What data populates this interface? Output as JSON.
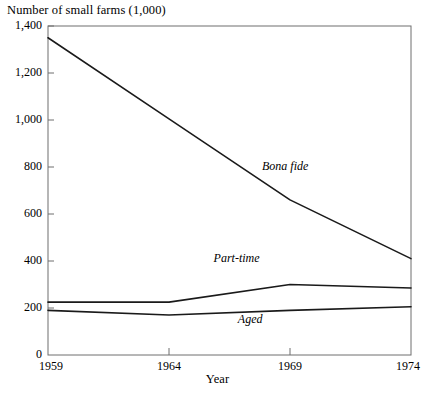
{
  "chart_data": {
    "type": "line",
    "title": "Number of small farms  (1,000)",
    "xlabel": "Year",
    "ylabel": "Number of small farms (1,000)",
    "x": [
      1959,
      1964,
      1969,
      1974
    ],
    "categories": [
      "1959",
      "1964",
      "1969",
      "1974"
    ],
    "xlim": [
      1959,
      1974
    ],
    "ylim": [
      0,
      1400
    ],
    "grid": false,
    "legend_position": "inline-annotations",
    "yticks": [
      0,
      200,
      400,
      600,
      800,
      1000,
      1200,
      1400
    ],
    "ytick_labels": [
      "0",
      "200",
      "400",
      "600",
      "800",
      "1,000",
      "1,200",
      "1,400"
    ],
    "xticks": [
      1959,
      1964,
      1969,
      1974
    ],
    "xtick_labels": [
      "1959",
      "1964",
      "1969",
      "1974"
    ],
    "line_color": "#1a1a1a",
    "axis_color": "#6e6e6e",
    "series": [
      {
        "name": "Bona fide",
        "values": [
          1350,
          1005,
          660,
          410
        ],
        "label_x": 1969,
        "label_y": 800
      },
      {
        "name": "Part-time",
        "values": [
          225,
          225,
          300,
          285
        ],
        "label_x": 1967,
        "label_y": 410
      },
      {
        "name": "Aged",
        "values": [
          190,
          170,
          190,
          205
        ],
        "label_x": 1968,
        "label_y": 150
      }
    ]
  }
}
